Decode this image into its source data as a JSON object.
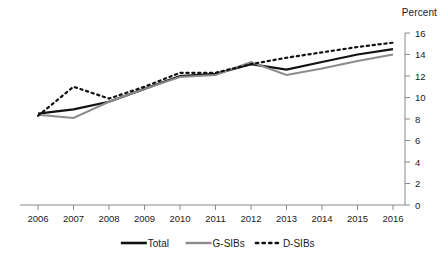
{
  "chart_data": {
    "type": "line",
    "title": "",
    "subtitle": "",
    "xlabel": "",
    "ylabel": "Percent",
    "unit_label": "Percent",
    "x": [
      2006,
      2007,
      2008,
      2009,
      2010,
      2011,
      2012,
      2013,
      2014,
      2015,
      2016
    ],
    "categories": [
      "2006",
      "2007",
      "2008",
      "2009",
      "2010",
      "2011",
      "2012",
      "2013",
      "2014",
      "2015",
      "2016"
    ],
    "xlim": [
      2006,
      2016
    ],
    "ylim": [
      0,
      16
    ],
    "yticks": [
      0,
      2,
      4,
      6,
      8,
      10,
      12,
      14,
      16
    ],
    "ytick_labels": [
      "0",
      "2",
      "4",
      "6",
      "8",
      "10",
      "12",
      "14",
      "16"
    ],
    "y_axis_position": "right",
    "grid": false,
    "legend_position": "bottom",
    "series": [
      {
        "name": "Total",
        "style": "solid",
        "color": "#111111",
        "width": 2.2,
        "values": [
          8.5,
          8.9,
          9.6,
          10.8,
          12.0,
          12.2,
          13.1,
          12.6,
          13.3,
          14.0,
          14.5
        ]
      },
      {
        "name": "G-SIBs",
        "style": "solid",
        "color": "#8c8c8c",
        "width": 2.0,
        "values": [
          8.4,
          8.1,
          9.6,
          10.8,
          11.9,
          12.1,
          13.3,
          12.1,
          12.7,
          13.4,
          14.0
        ]
      },
      {
        "name": "D-SIBs",
        "style": "dotted",
        "color": "#111111",
        "width": 2.2,
        "values": [
          8.3,
          11.0,
          9.9,
          11.0,
          12.3,
          12.3,
          13.1,
          13.7,
          14.2,
          14.7,
          15.1
        ]
      }
    ]
  },
  "legend": {
    "items": [
      {
        "label": "Total",
        "swatch": "solid-black-line"
      },
      {
        "label": "G-SIBs",
        "swatch": "solid-gray-line"
      },
      {
        "label": "D-SIBs",
        "swatch": "dotted-black-line"
      }
    ]
  },
  "colors": {
    "total": "#111111",
    "gsibs": "#8c8c8c",
    "dsibs": "#111111",
    "axis": "#8a8a8a",
    "text": "#1a1a1a",
    "background": "#ffffff"
  }
}
